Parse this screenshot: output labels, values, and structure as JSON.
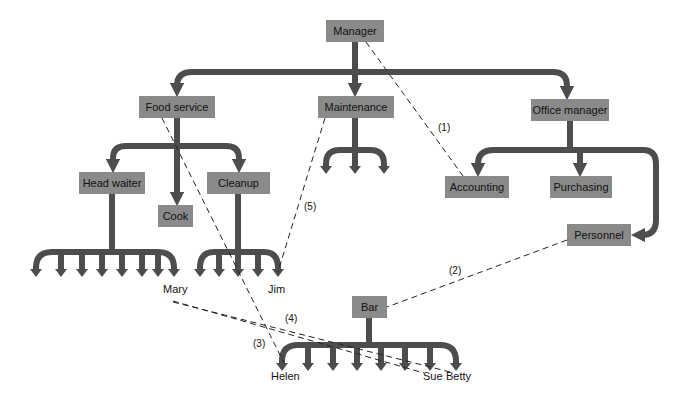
{
  "colors": {
    "box": "#8a8a8a",
    "arrow": "#4d4d4d",
    "dash": "#222222",
    "text": "#111111"
  },
  "boxes": {
    "manager": {
      "label": "Manager",
      "x": 326,
      "y": 20,
      "w": 58,
      "h": 22
    },
    "food_service": {
      "label": "Food service",
      "x": 139,
      "y": 96,
      "w": 76,
      "h": 22
    },
    "maintenance": {
      "label": "Maintenance",
      "x": 318,
      "y": 96,
      "w": 76,
      "h": 22
    },
    "office_manager": {
      "label": "Office manager",
      "x": 531,
      "y": 99,
      "w": 78,
      "h": 22
    },
    "head_waiter": {
      "label": "Head waiter",
      "x": 79,
      "y": 172,
      "w": 66,
      "h": 22
    },
    "cook": {
      "label": "Cook",
      "x": 158,
      "y": 205,
      "w": 35,
      "h": 22
    },
    "cleanup": {
      "label": "Cleanup",
      "x": 207,
      "y": 172,
      "w": 63,
      "h": 22
    },
    "accounting": {
      "label": "Accounting",
      "x": 445,
      "y": 176,
      "w": 64,
      "h": 22
    },
    "purchasing": {
      "label": "Purchasing",
      "x": 550,
      "y": 176,
      "w": 62,
      "h": 22
    },
    "personnel": {
      "label": "Personnel",
      "x": 567,
      "y": 224,
      "w": 64,
      "h": 22
    },
    "bar": {
      "label": "Bar",
      "x": 352,
      "y": 296,
      "w": 35,
      "h": 22
    }
  },
  "people": [
    {
      "name": "Mary",
      "x": 163,
      "y": 293
    },
    {
      "name": "Jim",
      "x": 268,
      "y": 293
    },
    {
      "name": "Helen",
      "x": 271,
      "y": 380
    },
    {
      "name": "Sue",
      "x": 423,
      "y": 380
    },
    {
      "name": "Betty",
      "x": 446,
      "y": 380
    }
  ],
  "links": [
    {
      "label": "(1)",
      "x": 438,
      "y": 131
    },
    {
      "label": "(2)",
      "x": 449,
      "y": 274
    },
    {
      "label": "(3)",
      "x": 253,
      "y": 347
    },
    {
      "label": "(4)",
      "x": 285,
      "y": 322
    },
    {
      "label": "(5)",
      "x": 304,
      "y": 210
    }
  ]
}
